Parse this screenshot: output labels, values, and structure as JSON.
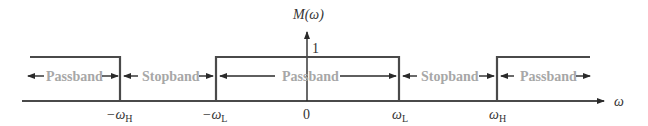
{
  "diagram": {
    "y_axis_label": "M(ω)",
    "x_axis_label": "ω",
    "level_label": "1",
    "ticks": [
      {
        "base": "−ω",
        "sub": "H"
      },
      {
        "base": "−ω",
        "sub": "L"
      },
      {
        "base": "0",
        "sub": ""
      },
      {
        "base": "ω",
        "sub": "L"
      },
      {
        "base": "ω",
        "sub": "H"
      }
    ],
    "bands": [
      {
        "label": "Passband",
        "region": "left"
      },
      {
        "label": "Stopband",
        "region": "left-stop"
      },
      {
        "label": "Passband",
        "region": "center"
      },
      {
        "label": "Stopband",
        "region": "right-stop"
      },
      {
        "label": "Passband",
        "region": "right"
      }
    ],
    "colors": {
      "line": "#4a4a4a",
      "band_text": "#a7a7a7",
      "tick_text": "#333333"
    }
  }
}
